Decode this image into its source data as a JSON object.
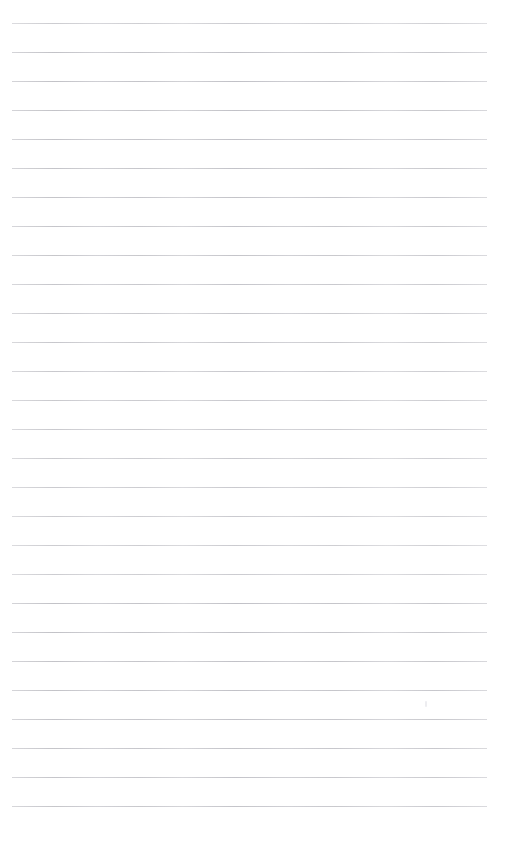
{
  "document": {
    "kind": "ruled-paper",
    "title": "",
    "body_text": "",
    "page_width": 511,
    "page_height": 859,
    "background_color": "#ffffff"
  },
  "ruling": {
    "line_color": "#c9c9cd",
    "line_thickness_px": 1,
    "line_spacing_px": 29,
    "first_line_y": 23,
    "line_left_x": 12,
    "line_right_x": 487,
    "line_count": 28,
    "lines_y": [
      23,
      52,
      81,
      110,
      139,
      168,
      197,
      226,
      255,
      284,
      313,
      342,
      371,
      400,
      429,
      458,
      487,
      516,
      545,
      574,
      603,
      632,
      661,
      690,
      719,
      748,
      777,
      806
    ]
  },
  "margins": {
    "top_px": 23,
    "left_px": 12,
    "right_px": 24,
    "bottom_px": 41
  },
  "artifacts": [
    {
      "name": "scan-speck",
      "x": 425,
      "y": 701,
      "width": 2,
      "height": 6
    }
  ]
}
